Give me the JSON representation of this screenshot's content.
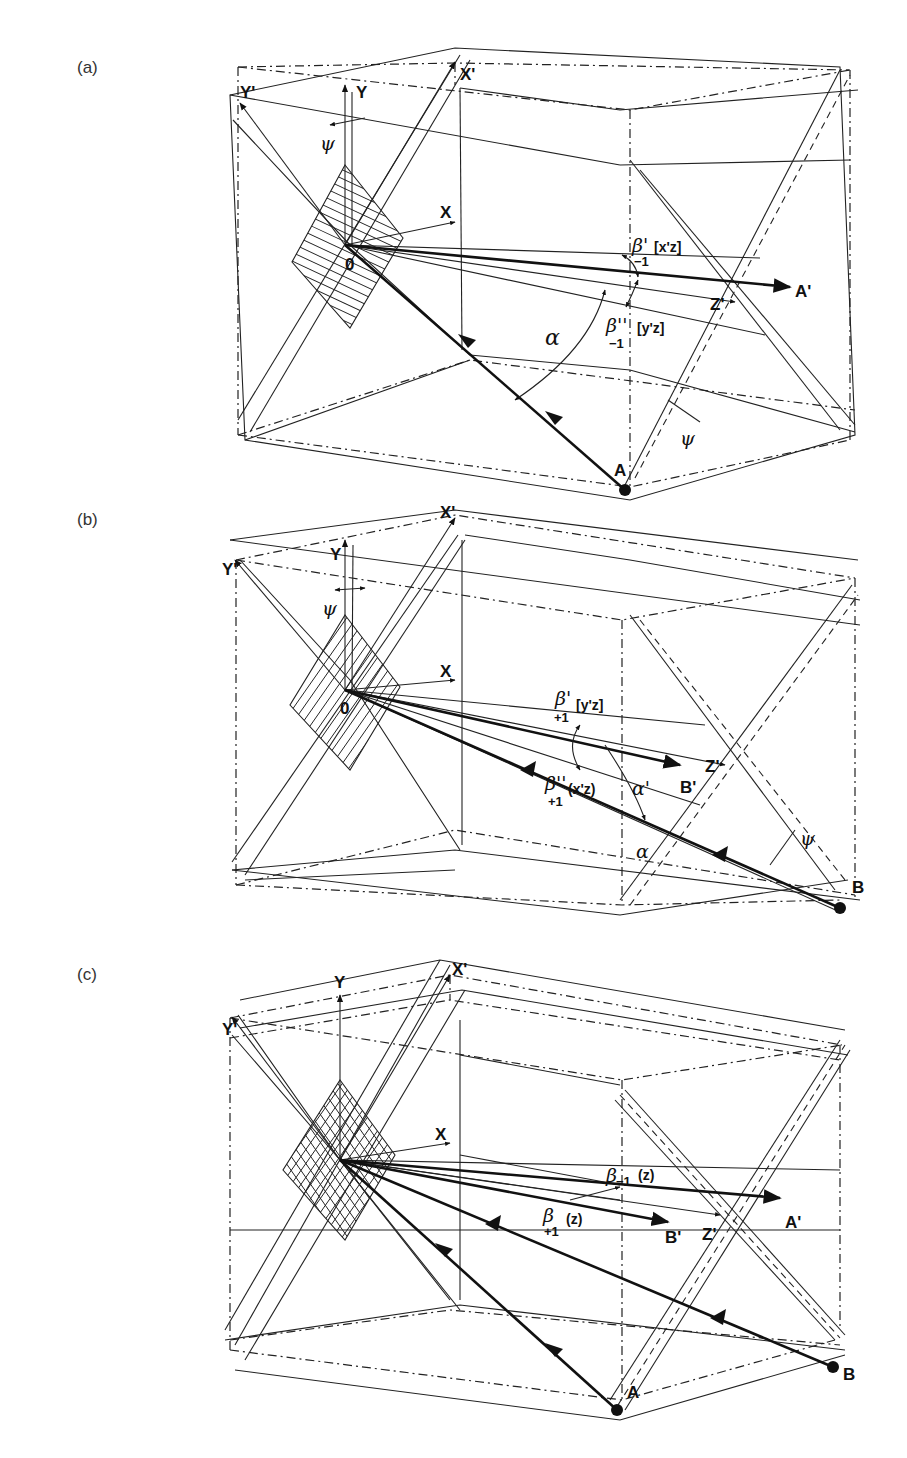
{
  "figure": {
    "panels": [
      {
        "id": "a",
        "label": "(a)",
        "axes": {
          "y_prime": "Y'",
          "y": "Y",
          "x_prime": "X'",
          "x": "X",
          "origin": "0",
          "z_prime": "Z'"
        },
        "points": {
          "source": "A",
          "image": "A'"
        },
        "angles": {
          "psi_top": "ψ",
          "psi_bottom": "ψ",
          "alpha": "α",
          "beta1_sym": "β'",
          "beta1_sub": "−1",
          "beta1_plane": "[x'z]",
          "beta2_sym": "β''",
          "beta2_sub": "−1",
          "beta2_plane": "[y'z]"
        }
      },
      {
        "id": "b",
        "label": "(b)",
        "axes": {
          "y_prime": "Y'",
          "y": "Y",
          "x_prime": "X'",
          "x": "X",
          "origin": "0",
          "z_prime": "Z'"
        },
        "points": {
          "source": "B",
          "image": "B'"
        },
        "angles": {
          "psi_top": "ψ",
          "psi_bottom": "ψ",
          "alpha": "α",
          "alpha_prime": "α'",
          "beta1_sym": "β'",
          "beta1_sub": "+1",
          "beta1_plane": "[y'z]",
          "beta2_sym": "β''",
          "beta2_sub": "+1",
          "beta2_plane": "(x'z)"
        }
      },
      {
        "id": "c",
        "label": "(c)",
        "axes": {
          "y_prime": "Y'",
          "y": "Y",
          "x_prime": "X'",
          "x": "X",
          "z_prime": "Z'"
        },
        "points": {
          "source_a": "A",
          "image_a": "A'",
          "source_b": "B",
          "image_b": "B'"
        },
        "angles": {
          "beta_minus_sym": "β",
          "beta_minus_sub": "−1",
          "beta_minus_plane": "(z)",
          "beta_plus_sym": "β",
          "beta_plus_sub": "+1",
          "beta_plus_plane": "(z)"
        }
      }
    ]
  }
}
